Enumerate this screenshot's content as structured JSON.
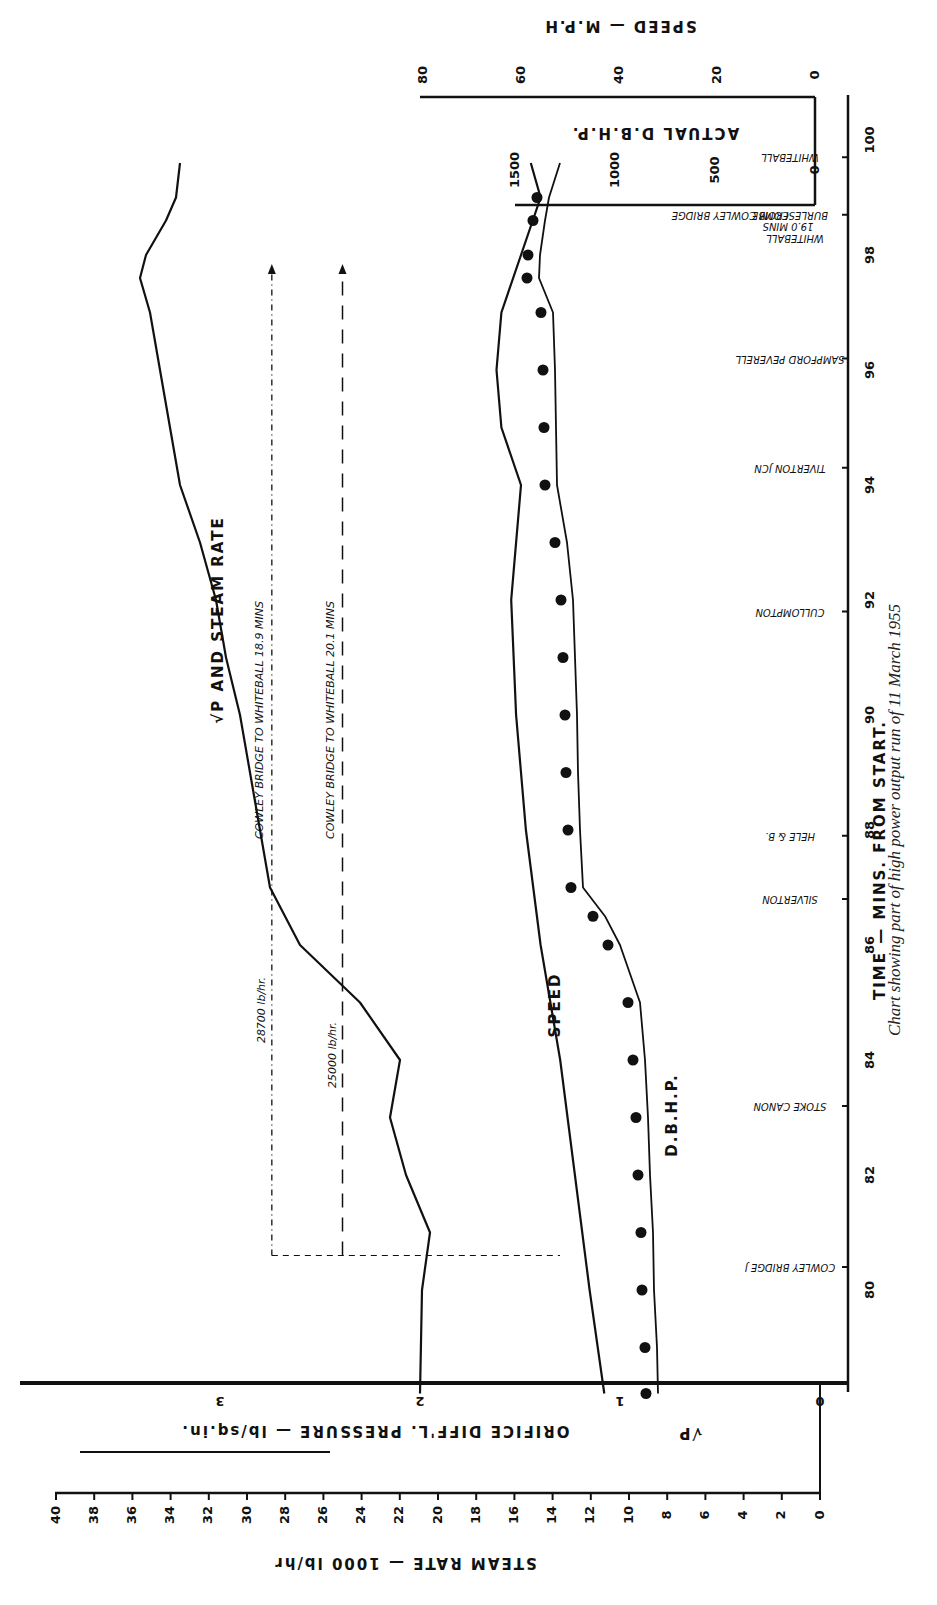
{
  "caption": "Chart showing part of high power output run of 11 March 1955",
  "axes": {
    "time": {
      "label": "TIME — MINS. FROM START.",
      "ticks": [
        "80",
        "82",
        "84",
        "86",
        "88",
        "90",
        "92",
        "94",
        "96",
        "98",
        "100"
      ]
    },
    "speed": {
      "label": "SPEED — M.P.H",
      "ticks": [
        "0",
        "20",
        "40",
        "60",
        "80"
      ]
    },
    "dbhp": {
      "label": "ACTUAL D.B.H.P.",
      "ticks": [
        "0",
        "500",
        "1000",
        "1500"
      ]
    },
    "sqrt_p": {
      "label": "ORIFICE DIFF'L. PRESSURE — lb/sq.in.",
      "symbol": "√P",
      "ticks": [
        "0",
        "1",
        "2",
        "3"
      ]
    },
    "steam_rate": {
      "label": "STEAM RATE — 1000 lb/hr",
      "ticks": [
        "0",
        "2",
        "4",
        "6",
        "8",
        "10",
        "12",
        "14",
        "16",
        "18",
        "20",
        "22",
        "24",
        "26",
        "28",
        "30",
        "32",
        "34",
        "36",
        "38",
        "40"
      ]
    }
  },
  "curve_labels": {
    "sqrtp_steam": "√P AND STEAM RATE",
    "speed": "SPEED",
    "dbhp": "D.B.H.P."
  },
  "annotations": {
    "rate_28700": "28700 lb/hr.",
    "rate_25000": "25000 lb/hr.",
    "run_189": "COWLEY BRIDGE TO WHITEBALL 18.9 MINS",
    "run_201": "COWLEY BRIDGE TO WHITEBALL 20.1 MINS",
    "whiteball_note_1": "WHITEBALL",
    "whiteball_note_2": "19.0 MINS",
    "whiteball_note_3": "FROM COWLEY BRIDGE"
  },
  "stations": [
    {
      "name": "COWLEY BRIDGE J",
      "time": 80.4
    },
    {
      "name": "STOKE CANON",
      "time": 83.2
    },
    {
      "name": "SILVERTON",
      "time": 86.8
    },
    {
      "name": "HELE & B.",
      "time": 87.9
    },
    {
      "name": "CULLOMPTON",
      "time": 91.8
    },
    {
      "name": "TIVERTON JCN",
      "time": 94.3
    },
    {
      "name": "SAMPFORD PEVERELL",
      "time": 96.2
    },
    {
      "name": "BURLESCOMBE",
      "time": 98.7
    },
    {
      "name": "WHITEBALL",
      "time": 99.7
    }
  ],
  "chart_data": {
    "type": "line",
    "xlabel": "TIME — MINS. FROM START.",
    "xlim": [
      78,
      101
    ],
    "series": [
      {
        "name": "√P and Steam Rate",
        "unit": "√P (lb/sq.in.)^0.5; steam rate 1000 lb/hr",
        "x": [
          78.2,
          80,
          81,
          82,
          83,
          84,
          85,
          86,
          87,
          88,
          89,
          90,
          91,
          92,
          93,
          94,
          95,
          96,
          97,
          97.6,
          98,
          98.6,
          99,
          99.6
        ],
        "values": [
          2.0,
          1.99,
          1.95,
          2.07,
          2.15,
          2.1,
          2.3,
          2.6,
          2.75,
          2.8,
          2.85,
          2.9,
          2.97,
          3.02,
          3.1,
          3.2,
          3.25,
          3.3,
          3.35,
          3.4,
          3.37,
          3.27,
          3.22,
          3.2
        ]
      },
      {
        "name": "Speed",
        "unit": "mph",
        "x": [
          78.2,
          80,
          82,
          84,
          86,
          88,
          90,
          92,
          94,
          95,
          96,
          97,
          98,
          99,
          99.6
        ],
        "values": [
          43,
          46,
          49,
          52,
          56,
          59,
          61,
          62,
          60,
          64,
          65,
          64,
          60,
          56,
          58
        ]
      },
      {
        "name": "D.B.H.P.",
        "unit": "hp",
        "x": [
          78.2,
          79,
          80,
          81,
          82,
          83,
          84,
          85,
          86,
          86.5,
          87,
          88,
          89,
          90,
          91,
          92,
          93,
          94,
          95,
          96,
          97,
          97.6,
          98,
          98.6,
          99,
          99.6
        ],
        "values": [
          785,
          790,
          805,
          810,
          825,
          835,
          850,
          875,
          975,
          1050,
          1160,
          1175,
          1185,
          1190,
          1200,
          1210,
          1240,
          1290,
          1295,
          1300,
          1310,
          1380,
          1375,
          1350,
          1330,
          1275
        ]
      }
    ],
    "reference_lines": [
      {
        "label": "28700 lb/hr — Cowley Bridge to Whiteball 18.9 mins",
        "steam_rate": 28.7,
        "from_time": 80.6
      },
      {
        "label": "25000 lb/hr — Cowley Bridge to Whiteball 20.1 mins",
        "steam_rate": 25.0,
        "from_time": 80.6
      }
    ],
    "axes_ranges": {
      "speed_mph": [
        0,
        80
      ],
      "dbhp": [
        0,
        1500
      ],
      "sqrt_p": [
        0,
        3
      ],
      "steam_rate_1000lb_hr": [
        0,
        40
      ]
    },
    "grid": false
  }
}
